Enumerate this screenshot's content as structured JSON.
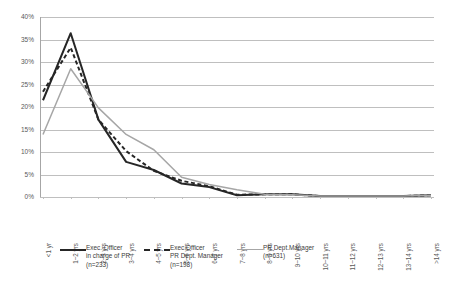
{
  "chart_data": {
    "type": "line",
    "title": "",
    "subtitle": "",
    "xlabel": "",
    "ylabel": "",
    "ylim": [
      0,
      40
    ],
    "ytick_values": [
      0,
      5,
      10,
      15,
      20,
      25,
      30,
      35,
      40
    ],
    "ytick_labels": [
      "0%",
      "5%",
      "10%",
      "15%",
      "20%",
      "25%",
      "30%",
      "35%",
      "40%"
    ],
    "grid": true,
    "legend_position": "bottom",
    "categories": [
      "<1 yr",
      "1~2 yrs",
      "2~3 yrs",
      "3~4 yrs",
      "4~5 yrs",
      "5~6 yrs",
      "6~7 yrs",
      "7~8 yrs",
      "8~9 yrs",
      "9~10 yrs",
      "10~11 yrs",
      "11~12 yrs",
      "12~13 yrs",
      "13~14 yrs",
      ">14 yrs"
    ],
    "series": [
      {
        "name": "Exec. Officer in charge of PR (n=233)",
        "style": "solid",
        "color": "#262626",
        "values": [
          21.5,
          36.4,
          17.2,
          7.8,
          6.0,
          3.0,
          2.2,
          0.4,
          0.6,
          0.6,
          0.2,
          0.2,
          0.2,
          0.2,
          0.4
        ]
      },
      {
        "name": "Exec.Officer PR Dept. Manager (n=198)",
        "style": "dashed",
        "color": "#262626",
        "values": [
          23.4,
          33.2,
          17.2,
          10.2,
          5.8,
          3.6,
          2.4,
          0.5,
          0.6,
          0.6,
          0.2,
          0.2,
          0.2,
          0.2,
          0.4
        ]
      },
      {
        "name": "PR Dept.Manager (n=631)",
        "style": "solid",
        "color": "#a6a6a6",
        "values": [
          13.9,
          28.5,
          19.8,
          13.9,
          10.5,
          4.4,
          2.8,
          1.6,
          0.6,
          0.5,
          0.2,
          0.2,
          0.2,
          0.2,
          0.4
        ]
      }
    ],
    "legend": [
      {
        "label_line1": "Exec. Officer",
        "label_line2": "in charge of PR",
        "label_line3": "(n=233)",
        "key": "solid-dark"
      },
      {
        "label_line1": "Exec.Officer",
        "label_line2": "PR Dept. Manager",
        "label_line3": "(n=198)",
        "key": "dash-dark"
      },
      {
        "label_line1": "PR Dept.Manager",
        "label_line2": "(n=631)",
        "label_line3": "",
        "key": "solid-grey"
      }
    ]
  }
}
